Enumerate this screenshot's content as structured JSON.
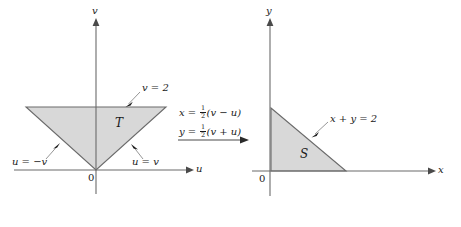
{
  "figure": {
    "background_color": "#ffffff",
    "line_color": "#5a5a5a",
    "fill_color": "#d8d8d8",
    "text_color": "#1a1a1a"
  },
  "left_panel": {
    "name": "uv-plane",
    "axes": {
      "horizontal_label": "u",
      "vertical_label": "v",
      "origin_label": "0"
    },
    "region_label": "T",
    "annotations": {
      "top_edge": "v = 2",
      "left_edge": "u = −v",
      "right_edge": "u = v"
    }
  },
  "transform": {
    "equation_x_lhs": "x",
    "equation_x_eq": "=",
    "equation_x_frac_num": "1",
    "equation_x_frac_den": "2",
    "equation_x_rhs": "(v − u)",
    "equation_y_lhs": "y",
    "equation_y_eq": "=",
    "equation_y_frac_num": "1",
    "equation_y_frac_den": "2",
    "equation_y_rhs": "(v + u)",
    "arrow": "arrow-right-icon"
  },
  "right_panel": {
    "name": "xy-plane",
    "axes": {
      "horizontal_label": "x",
      "vertical_label": "y",
      "origin_label": "0"
    },
    "region_label": "S",
    "annotations": {
      "hypotenuse": "x + y = 2"
    }
  }
}
